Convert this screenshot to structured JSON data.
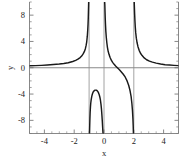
{
  "chart_data": {
    "type": "line",
    "title": "",
    "xlabel": "x",
    "ylabel": "y",
    "xlim": [
      -5,
      5
    ],
    "ylim": [
      -10,
      10
    ],
    "xticks": [
      -4,
      -2,
      0,
      2,
      4
    ],
    "xticklabels": [
      "-4",
      "-2",
      "0",
      "2",
      "4"
    ],
    "yticks": [
      -8,
      -4,
      0,
      4,
      8
    ],
    "yticklabels": [
      "-8",
      "-4",
      "0",
      "4",
      "8"
    ],
    "minor_ticks": true,
    "grid": false,
    "legend": null,
    "legend_position": "none",
    "curve_color": "#1a1a1a",
    "asymptote_color": "#8c8c8c",
    "axis_color": "#7a7a7a",
    "vertical_asymptotes": [
      -1,
      0,
      2
    ],
    "horizontal_asymptote": 0,
    "annotations": [
      {
        "label": "local maximum",
        "x": -0.55,
        "y": -3.4
      }
    ],
    "series": [
      {
        "name": "branch-left",
        "comment": "x from -5 up to vertical asymptote at x=-1; rises from y~0 to +inf",
        "x": [
          -5.0,
          -4.6,
          -4.2,
          -3.8,
          -3.4,
          -3.0,
          -2.7,
          -2.4,
          -2.1,
          -1.9,
          -1.75,
          -1.6,
          -1.5,
          -1.4,
          -1.32,
          -1.25,
          -1.2,
          -1.16,
          -1.12,
          -1.09,
          -1.07,
          -1.055,
          -1.045,
          -1.035,
          -1.028
        ],
        "y": [
          0.29,
          0.32,
          0.36,
          0.41,
          0.48,
          0.56,
          0.65,
          0.77,
          0.95,
          1.12,
          1.3,
          1.55,
          1.78,
          2.1,
          2.45,
          2.9,
          3.4,
          3.95,
          4.8,
          5.8,
          6.7,
          7.6,
          8.5,
          9.4,
          10.0
        ]
      },
      {
        "name": "branch-mid-negative",
        "comment": "between x=-1 and x=0; dips from -inf up to local max about -3.4 at x~-0.55 then back to -inf",
        "x": [
          -0.972,
          -0.965,
          -0.955,
          -0.945,
          -0.93,
          -0.91,
          -0.89,
          -0.86,
          -0.82,
          -0.78,
          -0.74,
          -0.7,
          -0.66,
          -0.62,
          -0.58,
          -0.55,
          -0.52,
          -0.48,
          -0.44,
          -0.4,
          -0.36,
          -0.32,
          -0.28,
          -0.24,
          -0.2,
          -0.17,
          -0.14,
          -0.115,
          -0.095,
          -0.08,
          -0.068,
          -0.058,
          -0.05
        ],
        "y": [
          -10.0,
          -9.4,
          -8.5,
          -7.7,
          -6.8,
          -6.0,
          -5.4,
          -4.85,
          -4.35,
          -4.0,
          -3.76,
          -3.6,
          -3.49,
          -3.43,
          -3.4,
          -3.4,
          -3.41,
          -3.46,
          -3.55,
          -3.68,
          -3.86,
          -4.1,
          -4.45,
          -4.9,
          -5.6,
          -6.3,
          -7.2,
          -8.1,
          -8.9,
          -9.5,
          -9.9,
          -10.0,
          -10.0
        ]
      },
      {
        "name": "branch-right-of-zero",
        "comment": "x from just right of 0 descending from +inf, crossing y=0 near x=1, to -inf at x=2",
        "x": [
          0.045,
          0.055,
          0.068,
          0.082,
          0.1,
          0.125,
          0.155,
          0.19,
          0.23,
          0.28,
          0.34,
          0.41,
          0.49,
          0.58,
          0.68,
          0.78,
          0.88,
          0.97,
          1.05,
          1.15,
          1.28,
          1.42,
          1.55,
          1.66,
          1.75,
          1.82,
          1.87,
          1.91,
          1.94,
          1.96,
          1.975
        ],
        "y": [
          10.0,
          9.6,
          8.6,
          7.6,
          6.6,
          5.5,
          4.6,
          3.8,
          3.1,
          2.5,
          2.0,
          1.55,
          1.15,
          0.82,
          0.52,
          0.26,
          0.04,
          -0.16,
          -0.34,
          -0.6,
          -0.95,
          -1.4,
          -2.0,
          -2.7,
          -3.5,
          -4.4,
          -5.4,
          -6.5,
          -7.7,
          -8.8,
          -10.0
        ]
      },
      {
        "name": "branch-far-right",
        "comment": "x from just right of 2 descending from +inf toward horizontal asymptote y=0",
        "x": [
          2.028,
          2.04,
          2.055,
          2.075,
          2.1,
          2.13,
          2.17,
          2.22,
          2.28,
          2.36,
          2.45,
          2.56,
          2.7,
          2.86,
          3.05,
          3.25,
          3.5,
          3.8,
          4.1,
          4.4,
          4.7,
          5.0
        ],
        "y": [
          10.0,
          9.2,
          8.2,
          7.2,
          6.2,
          5.3,
          4.5,
          3.8,
          3.2,
          2.65,
          2.2,
          1.85,
          1.5,
          1.22,
          1.0,
          0.85,
          0.7,
          0.57,
          0.47,
          0.41,
          0.36,
          0.32
        ]
      }
    ]
  },
  "axes": {
    "x_axis_title": "x",
    "y_axis_title": "y",
    "x_tick_labels": [
      "-4",
      "-2",
      "0",
      "2",
      "4"
    ],
    "y_tick_labels": [
      "8",
      "4",
      "0",
      "-4",
      "-8"
    ]
  }
}
